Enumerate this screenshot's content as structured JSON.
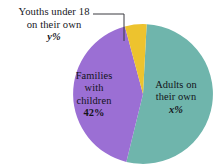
{
  "chart_data": {
    "type": "pie",
    "title": "",
    "categories": [
      "Adults on their own",
      "Families with children",
      "Youths under 18 on their own"
    ],
    "values": [
      53,
      42,
      5
    ],
    "value_labels": [
      "x%",
      "42%",
      "y%"
    ],
    "colors": [
      "#6FB5AC",
      "#9B6FD4",
      "#EDC32E"
    ],
    "legend": "none",
    "labels_inside": [
      true,
      true,
      false
    ],
    "background": "#FFFFFF",
    "text_color": "#16161C"
  },
  "callout": {
    "line1": "Youths under 18",
    "line2": "on their own",
    "value": "y%"
  },
  "slices": {
    "families": {
      "line1": "Families",
      "line2": "with",
      "line3": "children",
      "value": "42%"
    },
    "adults": {
      "line1": "Adults on",
      "line2": "their own",
      "value": "x%"
    }
  }
}
